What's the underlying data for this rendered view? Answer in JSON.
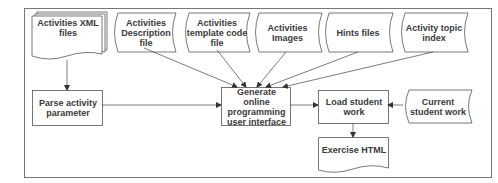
{
  "diagram": {
    "type": "flowchart",
    "colors": {
      "stroke": "#555555",
      "text": "#3a3a3a",
      "background": "#ffffff"
    },
    "nodes": [
      {
        "id": "xml",
        "shape": "multi-document",
        "label": "Activities XML files"
      },
      {
        "id": "desc",
        "shape": "stored-data",
        "label": "Activities Description file"
      },
      {
        "id": "tmpl",
        "shape": "stored-data",
        "label": "Activities template code file"
      },
      {
        "id": "img",
        "shape": "stored-data",
        "label": "Activities Images"
      },
      {
        "id": "hints",
        "shape": "stored-data",
        "label": "Hints files"
      },
      {
        "id": "topic",
        "shape": "stored-data",
        "label": "Activity topic index"
      },
      {
        "id": "parse",
        "shape": "process",
        "label": "Parse activity parameter"
      },
      {
        "id": "gen",
        "shape": "process",
        "label": "Generate online programming user interface"
      },
      {
        "id": "load",
        "shape": "process",
        "label": "Load student work"
      },
      {
        "id": "cur",
        "shape": "stored-data",
        "label": "Current student work"
      },
      {
        "id": "html",
        "shape": "document",
        "label": "Exercise HTML"
      }
    ],
    "edges": [
      {
        "from": "xml",
        "to": "parse"
      },
      {
        "from": "parse",
        "to": "gen"
      },
      {
        "from": "desc",
        "to": "gen"
      },
      {
        "from": "tmpl",
        "to": "gen"
      },
      {
        "from": "img",
        "to": "gen"
      },
      {
        "from": "hints",
        "to": "gen"
      },
      {
        "from": "topic",
        "to": "gen"
      },
      {
        "from": "gen",
        "to": "load"
      },
      {
        "from": "cur",
        "to": "load"
      },
      {
        "from": "load",
        "to": "html"
      }
    ]
  }
}
